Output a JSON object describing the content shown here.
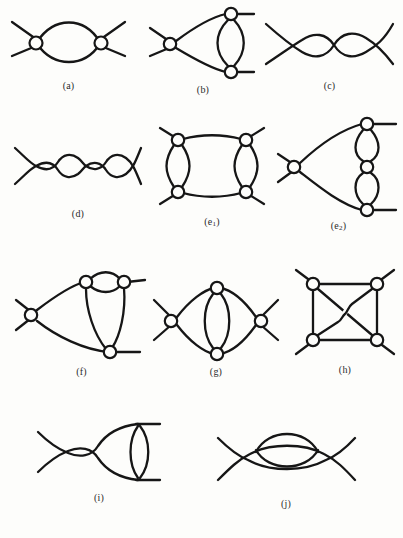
{
  "figure": {
    "kind": "feynman-diagram-plate",
    "background_color": "#fdfdfb",
    "ink_color": "#161616",
    "vertex_fill_color": "#fdfdfb",
    "total_diagrams": 10,
    "rows": 4
  },
  "diagrams": [
    {
      "id": "a",
      "label": "(a)",
      "row": 1,
      "column": 1,
      "description": "Two circled vertices joined by a two-arc bubble; each vertex carries a pair of crossed external legs.",
      "vertices": 2,
      "internal_lines": 2,
      "external_legs": 4
    },
    {
      "id": "b",
      "label": "(b)",
      "row": 1,
      "column": 2,
      "description": "Left circled vertex with crossed legs connects by two curves to an upper-right and a lower-right circled vertex, which are joined by a vertical two-arc bubble; each right vertex carries one horizontal external leg.",
      "vertices": 3,
      "internal_lines": 4,
      "external_legs": 4
    },
    {
      "id": "c",
      "label": "(c)",
      "row": 1,
      "column": 3,
      "description": "Chain of two lens-shaped bubbles joined at a crossing, with crossed external legs at both ends.",
      "vertices": 3,
      "internal_lines": 4,
      "external_legs": 4
    },
    {
      "id": "d",
      "label": "(d)",
      "row": 2,
      "column": 1,
      "description": "Chain of three lens-shaped bubbles joined at crossings, with crossed external legs at both ends.",
      "vertices": 4,
      "internal_lines": 6,
      "external_legs": 4
    },
    {
      "id": "e1",
      "label": "(e",
      "label_sub": "1",
      "label_tail": ")",
      "row": 2,
      "column": 2,
      "description": "Square of four circled vertices: straight top and bottom rails, two-arc bubbles on the left and right sides, one diagonal external leg at each corner.",
      "vertices": 4,
      "internal_lines": 6,
      "external_legs": 4
    },
    {
      "id": "e2",
      "label": "(e",
      "label_sub": "2",
      "label_tail": ")",
      "row": 2,
      "column": 3,
      "description": "Left circled vertex with crossed legs curves to upper-right and lower-right vertices; the right side is a vertical chain with a middle vertex, two-arc bubbles above and below it.",
      "vertices": 4,
      "internal_lines": 6,
      "external_legs": 4
    },
    {
      "id": "f",
      "label": "(f)",
      "row": 3,
      "column": 1,
      "description": "Left circled vertex with crossed legs curves to two upper vertices joined by a small bubble, and to a bottom vertex; both upper vertices drop down to the bottom vertex.",
      "vertices": 4,
      "internal_lines": 6,
      "external_legs": 4
    },
    {
      "id": "g",
      "label": "(g)",
      "row": 3,
      "column": 2,
      "description": "Left and right circled vertices with crossed legs joined by two large arcs forming a lens; top and bottom vertices sit on those arcs and are joined by a vertical two-arc bubble.",
      "vertices": 4,
      "internal_lines": 6,
      "external_legs": 4
    },
    {
      "id": "h",
      "label": "(h)",
      "row": 3,
      "column": 3,
      "description": "Square of four circled vertices with straight sides plus both diagonals; one diagonal hops over the other at the centre crossing. A diagonal external leg at each corner.",
      "vertices": 4,
      "internal_lines": 6,
      "external_legs": 4
    },
    {
      "id": "i",
      "label": "(i)",
      "row": 4,
      "column": 1,
      "description": "Left crossing with legs, a lens bubble, a middle crossing, then two curves to the right ends which are joined by a tall two-arc bubble with horizontal stubs.",
      "vertices": 4,
      "internal_lines": 6,
      "external_legs": 4
    },
    {
      "id": "j",
      "label": "(j)",
      "row": 4,
      "column": 2,
      "description": "Left and right crossings with legs joined by two large arcs; an extra lens sits in the upper region crossing the upper arc.",
      "vertices": 4,
      "internal_lines": 6,
      "external_legs": 4
    }
  ]
}
